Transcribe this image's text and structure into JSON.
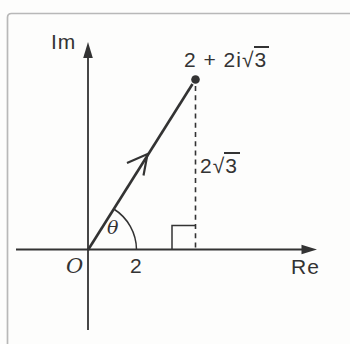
{
  "figure": {
    "im_axis_label": "Im",
    "re_axis_label": "Re",
    "origin_label": "O",
    "angle_label": "θ",
    "real_tick_label": "2",
    "point_label": {
      "prefix": "2 + 2i",
      "radical": "√",
      "radicand": "3"
    },
    "height_label": {
      "prefix": "2",
      "radical": "√",
      "radicand": "3"
    }
  },
  "colors": {
    "ink": "#333333",
    "frame": "#b8b8b8",
    "background": "#fdfdfc"
  }
}
